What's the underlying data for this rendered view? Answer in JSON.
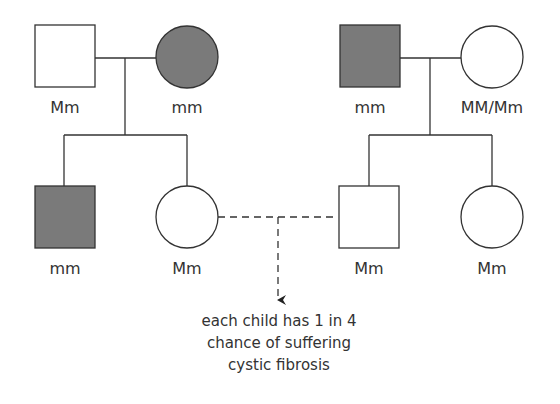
{
  "diagram": {
    "type": "pedigree",
    "colors": {
      "affected": "#7a7a7a",
      "unaffected": "#ffffff",
      "stroke": "#333333"
    },
    "family_left": {
      "father": {
        "shape": "square",
        "affected": false,
        "genotype": "Mm"
      },
      "mother": {
        "shape": "circle",
        "affected": true,
        "genotype": "mm"
      },
      "children": [
        {
          "shape": "square",
          "affected": true,
          "genotype": "mm"
        },
        {
          "shape": "circle",
          "affected": false,
          "genotype": "Mm"
        }
      ]
    },
    "family_right": {
      "father": {
        "shape": "square",
        "affected": true,
        "genotype": "mm"
      },
      "mother": {
        "shape": "circle",
        "affected": false,
        "genotype": "MM/Mm"
      },
      "children": [
        {
          "shape": "square",
          "affected": false,
          "genotype": "Mm"
        },
        {
          "shape": "circle",
          "affected": false,
          "genotype": "Mm"
        }
      ]
    },
    "union_note": {
      "lines": [
        "each child has 1 in 4",
        "chance of suffering",
        "cystic fibrosis"
      ]
    }
  }
}
